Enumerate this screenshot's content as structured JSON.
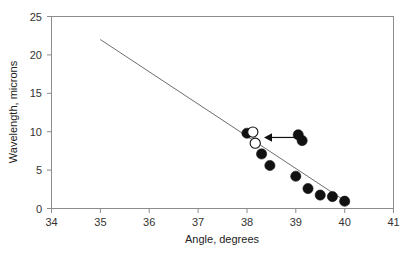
{
  "chart_data": {
    "type": "scatter",
    "title": "",
    "xlabel": "Angle, degrees",
    "ylabel": "Wavelength, microns",
    "xlim": [
      34,
      41
    ],
    "ylim": [
      0,
      25
    ],
    "xticks": [
      34,
      35,
      36,
      37,
      38,
      39,
      40,
      41
    ],
    "yticks": [
      0,
      5,
      10,
      15,
      20,
      25
    ],
    "xtick_labels": [
      "34",
      "35",
      "36",
      "37",
      "38",
      "39",
      "40",
      "41"
    ],
    "ytick_labels": [
      "0",
      "5",
      "10",
      "15",
      "20",
      "25"
    ],
    "grid": false,
    "legend": "none",
    "series": [
      {
        "name": "filled-markers",
        "marker": "filled-circle",
        "color": "#111111",
        "points": [
          {
            "x": 38.0,
            "y": 9.8
          },
          {
            "x": 38.3,
            "y": 7.1
          },
          {
            "x": 38.47,
            "y": 5.6
          },
          {
            "x": 39.0,
            "y": 4.2
          },
          {
            "x": 39.25,
            "y": 2.6
          },
          {
            "x": 39.5,
            "y": 1.75
          },
          {
            "x": 39.75,
            "y": 1.55
          },
          {
            "x": 40.0,
            "y": 0.95
          }
        ]
      },
      {
        "name": "open-markers",
        "marker": "open-circle",
        "color": "#ffffff",
        "points": [
          {
            "x": 38.12,
            "y": 9.95
          },
          {
            "x": 38.17,
            "y": 8.5
          }
        ]
      },
      {
        "name": "annotated-pair",
        "marker": "filled-circle",
        "color": "#111111",
        "points": [
          {
            "x": 39.05,
            "y": 9.6
          },
          {
            "x": 39.13,
            "y": 8.85
          }
        ]
      }
    ],
    "fit_line": {
      "name": "trend-line",
      "color": "#6e6e6e",
      "x_start": 35.0,
      "y_start": 22.0,
      "x_end": 40.1,
      "y_end": 0.6
    },
    "annotations": [
      {
        "type": "arrow",
        "name": "leftward-arrow",
        "x_tail": 39.0,
        "y_tail": 9.25,
        "x_head": 38.35,
        "y_head": 9.25,
        "direction": "left",
        "color": "#111111"
      }
    ]
  }
}
